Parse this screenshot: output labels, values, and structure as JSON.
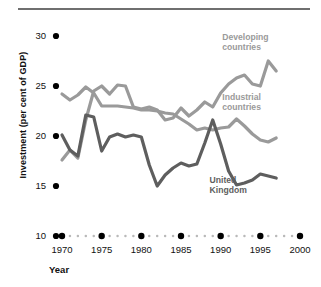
{
  "figure": {
    "top_rule_color": "#6f6f6f",
    "background": "#ffffff"
  },
  "axes": {
    "ylabel": "Investment (per cent of GDP)",
    "xlabel": "Year",
    "y_ticks": [
      30,
      25,
      20,
      15,
      10
    ],
    "y_tick_labels": [
      "30",
      "25",
      "20",
      "15",
      "10"
    ],
    "ylim": [
      10,
      31.2
    ],
    "xlim": [
      1970,
      2000
    ],
    "x_major_ticks": [
      1970,
      1975,
      1980,
      1985,
      1990,
      1995,
      2000
    ],
    "x_major_tick_labels": [
      "1970",
      "1975",
      "1980",
      "1985",
      "1990",
      "1995",
      "2000"
    ],
    "tick_marker_color": "#000000",
    "minor_dot_color": "#b9b9b9",
    "grid": false
  },
  "annotations": [
    {
      "text_line1": "Developing",
      "text_line2": "countries",
      "color": "#9a9a9a",
      "x": 1990.2,
      "y": 29.6
    },
    {
      "text_line1": "Industrial",
      "text_line2": "countries",
      "color": "#9a9a9a",
      "x": 1990.2,
      "y": 23.6
    },
    {
      "text_line1": "United",
      "text_line2": "Kingdom",
      "color": "#5e5e5e",
      "x": 1988.6,
      "y": 15.3
    }
  ],
  "chart_data": {
    "type": "line",
    "title": "",
    "xlabel": "Year",
    "ylabel": "Investment (per cent of GDP)",
    "xlim": [
      1970,
      2000
    ],
    "ylim": [
      10,
      31.2
    ],
    "grid": false,
    "legend_position": "inline-annotations",
    "x": [
      1970,
      1971,
      1972,
      1973,
      1974,
      1975,
      1976,
      1977,
      1978,
      1979,
      1980,
      1981,
      1982,
      1983,
      1984,
      1985,
      1986,
      1987,
      1988,
      1989,
      1990,
      1991,
      1992,
      1993,
      1994,
      1995,
      1996,
      1997
    ],
    "series": [
      {
        "name": "Developing countries",
        "color": "#9a9a9a",
        "values": [
          17.6,
          18.6,
          17.8,
          21.6,
          24.5,
          25.0,
          24.2,
          25.1,
          25.0,
          22.9,
          22.7,
          22.9,
          22.6,
          21.6,
          21.8,
          22.8,
          22.0,
          22.6,
          23.4,
          22.9,
          24.3,
          25.2,
          25.8,
          26.1,
          25.2,
          25.0,
          27.5,
          26.5
        ]
      },
      {
        "name": "Industrial countries",
        "color": "#9a9a9a",
        "values": [
          24.2,
          23.6,
          24.1,
          24.9,
          24.3,
          23.0,
          23.0,
          23.0,
          22.9,
          22.8,
          22.6,
          22.6,
          22.5,
          22.3,
          22.2,
          21.7,
          21.2,
          20.6,
          20.8,
          20.6,
          20.8,
          20.9,
          21.7,
          21.0,
          20.2,
          19.6,
          19.4,
          19.8
        ]
      },
      {
        "name": "United Kingdom",
        "color": "#5e5e5e",
        "values": [
          20.1,
          18.6,
          18.0,
          22.1,
          21.9,
          18.5,
          19.9,
          20.2,
          19.9,
          20.1,
          19.9,
          17.1,
          15.0,
          16.1,
          16.8,
          17.3,
          17.0,
          17.2,
          19.3,
          21.6,
          19.2,
          16.5,
          15.1,
          15.3,
          15.6,
          16.2,
          16.0,
          15.8
        ]
      }
    ]
  }
}
